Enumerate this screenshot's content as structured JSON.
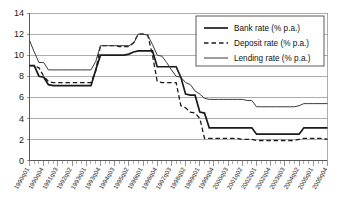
{
  "chart_data": {
    "type": "line",
    "title": "",
    "subtitle": "",
    "xlabel": "",
    "ylabel": "",
    "ylim": [
      0,
      14
    ],
    "ytick_values": [
      0,
      2,
      4,
      6,
      8,
      10,
      12,
      14
    ],
    "ytick_labels": [
      "0",
      "2",
      "4",
      "6",
      "8",
      "10",
      "12",
      "14"
    ],
    "grid": true,
    "grid_axis": "y",
    "legend_position": "top-right",
    "x": [
      "1990q01",
      "1990q02",
      "1990q03",
      "1990q04",
      "1991q01",
      "1991q02",
      "1991q03",
      "1991q04",
      "1992q01",
      "1992q02",
      "1992q03",
      "1992q04",
      "1993q01",
      "1993q02",
      "1993q03",
      "1993q04",
      "1994q01",
      "1994q02",
      "1994q03",
      "1994q04",
      "1995q01",
      "1995q02",
      "1995q03",
      "1995q04",
      "1996q01",
      "1996q02",
      "1996q03",
      "1996q04",
      "1997q01",
      "1997q02",
      "1997q03",
      "1997q04",
      "1998q01",
      "1998q02",
      "1998q03",
      "1998q04",
      "1999q01",
      "1999q02",
      "1999q03",
      "1999q04",
      "2000q01",
      "2000q02",
      "2000q03",
      "2000q04",
      "2001q01",
      "2001q02",
      "2001q03",
      "2001q04",
      "2002q01",
      "2002q02",
      "2002q03",
      "2002q04",
      "2003q01",
      "2003q02",
      "2003q03",
      "2003q04",
      "2004q01",
      "2004q02",
      "2004q03",
      "2004q04",
      "2005q01",
      "2005q02",
      "2005q03",
      "2005q04"
    ],
    "xtick_labels_shown": [
      "1990q01",
      "1990q04",
      "1991q03",
      "1992q02",
      "1993q01",
      "1993q04",
      "1994q03",
      "1995q02",
      "1996q01",
      "1996q04",
      "1997q03",
      "1998q02",
      "1999q01",
      "1999q04",
      "2000q03",
      "2001q02",
      "2002q01",
      "2002q04",
      "2003q03",
      "2004q02",
      "2005q01",
      "2005q04"
    ],
    "xtick_label_interval": 3,
    "series": [
      {
        "name": "Bank rate (% p.a.)",
        "style": "solid",
        "width": 1.7,
        "color": "#1a1a1a",
        "values": [
          9.0,
          9.0,
          8.0,
          7.9,
          7.2,
          7.1,
          7.1,
          7.1,
          7.1,
          7.1,
          7.1,
          7.1,
          7.1,
          7.1,
          8.6,
          10.0,
          10.0,
          10.0,
          10.0,
          10.0,
          10.0,
          10.1,
          10.3,
          10.4,
          10.4,
          10.4,
          10.4,
          8.9,
          8.9,
          8.9,
          8.9,
          8.9,
          7.9,
          6.3,
          6.2,
          6.2,
          4.6,
          4.5,
          3.1,
          3.1,
          3.1,
          3.1,
          3.1,
          3.1,
          3.1,
          3.1,
          3.1,
          3.1,
          2.5,
          2.5,
          2.5,
          2.5,
          2.5,
          2.5,
          2.5,
          2.5,
          2.5,
          2.5,
          3.1,
          3.1,
          3.1,
          3.1,
          3.1,
          3.1
        ]
      },
      {
        "name": "Deposit rate (% p.a.)",
        "style": "dashed",
        "width": 1.3,
        "color": "#1a1a1a",
        "values": [
          9.0,
          9.0,
          8.8,
          8.0,
          7.5,
          7.4,
          7.4,
          7.4,
          7.4,
          7.4,
          7.4,
          7.4,
          7.4,
          7.4,
          8.5,
          10.9,
          10.9,
          10.9,
          10.9,
          10.8,
          10.8,
          10.8,
          11.2,
          12.0,
          12.0,
          11.9,
          10.0,
          7.5,
          7.4,
          7.4,
          7.4,
          7.4,
          5.2,
          5.0,
          4.6,
          4.5,
          4.0,
          2.1,
          2.1,
          2.1,
          2.1,
          2.1,
          2.1,
          2.1,
          2.1,
          2.0,
          2.0,
          2.0,
          1.9,
          1.9,
          1.9,
          1.9,
          1.9,
          1.9,
          1.9,
          1.9,
          1.9,
          2.0,
          2.1,
          2.1,
          2.1,
          2.1,
          2.1,
          2.0
        ]
      },
      {
        "name": "Lending rate (% p.a.)",
        "style": "solid",
        "width": 1.0,
        "color": "#3a3a3a",
        "values": [
          11.4,
          10.3,
          9.3,
          9.3,
          8.6,
          8.6,
          8.6,
          8.6,
          8.6,
          8.6,
          8.6,
          8.6,
          8.6,
          8.6,
          9.4,
          10.9,
          10.9,
          10.9,
          10.9,
          10.9,
          10.9,
          10.9,
          11.1,
          12.0,
          12.0,
          11.9,
          11.0,
          10.0,
          9.9,
          9.3,
          8.6,
          8.0,
          7.9,
          7.4,
          7.2,
          6.6,
          6.3,
          5.9,
          5.8,
          5.8,
          5.8,
          5.8,
          5.8,
          5.8,
          5.8,
          5.8,
          5.7,
          5.7,
          5.1,
          5.1,
          5.1,
          5.1,
          5.1,
          5.1,
          5.1,
          5.1,
          5.1,
          5.2,
          5.4,
          5.4,
          5.4,
          5.4,
          5.4,
          5.4
        ]
      }
    ],
    "legend": [
      {
        "label": "Bank rate (% p.a.)",
        "style": "solid",
        "width": 1.7,
        "color": "#1a1a1a"
      },
      {
        "label": "Deposit rate (% p.a.)",
        "style": "dashed",
        "width": 1.3,
        "color": "#1a1a1a"
      },
      {
        "label": "Lending rate (% p.a.)",
        "style": "solid",
        "width": 1.0,
        "color": "#3a3a3a"
      }
    ]
  }
}
